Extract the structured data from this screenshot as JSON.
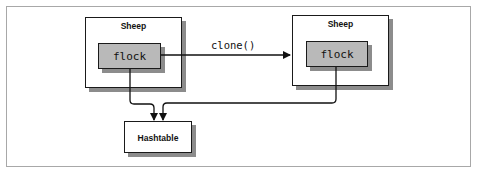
{
  "diagram": {
    "nodes": {
      "sheep_left": {
        "title": "Sheep",
        "field": "flock"
      },
      "sheep_right": {
        "title": "Sheep",
        "field": "flock"
      },
      "hashtable": {
        "label": "Hashtable"
      }
    },
    "edges": [
      {
        "from": "sheep_left",
        "to": "sheep_right",
        "label": "clone()"
      },
      {
        "from": "sheep_left.flock",
        "to": "hashtable",
        "label": ""
      },
      {
        "from": "sheep_right.flock",
        "to": "hashtable",
        "label": ""
      }
    ],
    "colors": {
      "box_border": "#1a1a1a",
      "inner_fill": "#b9b9b9",
      "shadow": "#8c8c8c",
      "frame_border": "#a8a8a8"
    }
  }
}
